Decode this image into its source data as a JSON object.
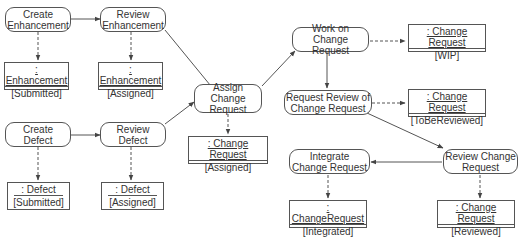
{
  "diagram": {
    "type": "UML activity diagram",
    "activities": [
      {
        "id": "create_enh",
        "lines": [
          "Create",
          "Enhancement"
        ]
      },
      {
        "id": "review_enh",
        "lines": [
          "Review",
          "Enhancement"
        ]
      },
      {
        "id": "create_def",
        "lines": [
          "Create",
          "Defect"
        ]
      },
      {
        "id": "review_def",
        "lines": [
          "Review",
          "Defect"
        ]
      },
      {
        "id": "assign_cr",
        "lines": [
          "Assign Change",
          "Request"
        ]
      },
      {
        "id": "work_cr",
        "lines": [
          "Work on",
          "Change Request"
        ]
      },
      {
        "id": "req_review",
        "lines": [
          "Request Review of",
          "Change Request"
        ]
      },
      {
        "id": "review_cr",
        "lines": [
          "Review Change",
          "Request"
        ]
      },
      {
        "id": "integrate_cr",
        "lines": [
          "Integrate",
          "Change Request"
        ]
      }
    ],
    "objects": [
      {
        "id": "enh_sub",
        "name": ": Enhancement",
        "state": "[Submitted]"
      },
      {
        "id": "enh_asg",
        "name": ": Enhancement",
        "state": "[Assigned]"
      },
      {
        "id": "def_sub",
        "name": ": Defect",
        "state": "[Submitted]"
      },
      {
        "id": "def_asg",
        "name": ": Defect",
        "state": "[Assigned]"
      },
      {
        "id": "cr_asg",
        "name": ": Change Request",
        "state": "[Assigned]"
      },
      {
        "id": "cr_wip",
        "name": ": Change Request",
        "state": "[WIP]"
      },
      {
        "id": "cr_tbr",
        "name": ": Change Request",
        "state": "[ToBeReviewed]"
      },
      {
        "id": "cr_int",
        "name": ": ChangeRequest",
        "state": "[Integrated]"
      },
      {
        "id": "cr_rev",
        "name": ": Change Request",
        "state": "[Reviewed]"
      }
    ],
    "control_flows": [
      [
        "create_enh",
        "review_enh"
      ],
      [
        "review_enh",
        "assign_cr"
      ],
      [
        "create_def",
        "review_def"
      ],
      [
        "review_def",
        "assign_cr"
      ],
      [
        "assign_cr",
        "work_cr"
      ],
      [
        "work_cr",
        "req_review"
      ],
      [
        "req_review",
        "review_cr"
      ],
      [
        "review_cr",
        "integrate_cr"
      ]
    ],
    "object_flows": [
      [
        "create_enh",
        "enh_sub"
      ],
      [
        "review_enh",
        "enh_asg"
      ],
      [
        "create_def",
        "def_sub"
      ],
      [
        "review_def",
        "def_asg"
      ],
      [
        "assign_cr",
        "cr_asg"
      ],
      [
        "work_cr",
        "cr_wip"
      ],
      [
        "req_review",
        "cr_tbr"
      ],
      [
        "integrate_cr",
        "cr_int"
      ],
      [
        "review_cr",
        "cr_rev"
      ]
    ],
    "colors": {
      "line": "#555555",
      "text": "#333333",
      "background": "#ffffff"
    }
  }
}
